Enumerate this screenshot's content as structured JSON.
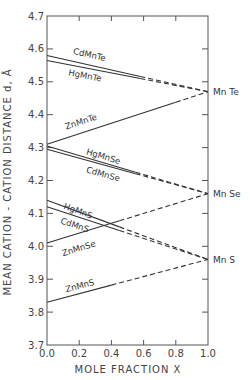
{
  "chart_data": {
    "type": "line",
    "title": "",
    "xlabel": "MOLE FRACTION X",
    "ylabel": "MEAN CATION - CATION DISTANCE  d, Å",
    "xlim": [
      0.0,
      1.0
    ],
    "ylim": [
      3.7,
      4.7
    ],
    "x_ticks": [
      "0.0",
      "0.2",
      "0.4",
      "0.6",
      "0.8",
      "1.0"
    ],
    "y_ticks": [
      "3.7",
      "3.8",
      "3.9",
      "4.0",
      "4.1",
      "4.2",
      "4.3",
      "4.4",
      "4.5",
      "4.6",
      "4.7"
    ],
    "grid": false,
    "legend": "inline labels",
    "endpoint_labels": [
      {
        "label": "Mn Te",
        "y": 4.47
      },
      {
        "label": "Mn Se",
        "y": 4.16
      },
      {
        "label": "Mn S",
        "y": 3.96
      }
    ],
    "series": [
      {
        "name": "CdMnTe",
        "x": [
          0.0,
          0.58,
          1.0
        ],
        "values": [
          4.58,
          4.516,
          4.47
        ],
        "solid_until": 0.58,
        "label_pos": [
          0.16,
          4.585
        ]
      },
      {
        "name": "HgMnTe",
        "x": [
          0.0,
          0.58,
          1.0
        ],
        "values": [
          4.565,
          4.51,
          4.47
        ],
        "solid_until": 0.58,
        "label_pos": [
          0.13,
          4.52
        ]
      },
      {
        "name": "ZnMnTe",
        "x": [
          0.0,
          0.8,
          1.0
        ],
        "values": [
          4.31,
          4.438,
          4.47
        ],
        "solid_until": 0.8,
        "label_pos": [
          0.12,
          4.355
        ]
      },
      {
        "name": "HgMnSe",
        "x": [
          0.0,
          0.6,
          1.0
        ],
        "values": [
          4.305,
          4.218,
          4.16
        ],
        "solid_until": 0.55,
        "label_pos": [
          0.24,
          4.28
        ]
      },
      {
        "name": "CdMnSe",
        "x": [
          0.0,
          0.6,
          1.0
        ],
        "values": [
          4.295,
          4.21,
          4.16
        ],
        "solid_until": 0.55,
        "label_pos": [
          0.24,
          4.225
        ]
      },
      {
        "name": "HgMnS",
        "x": [
          0.0,
          0.45,
          1.0
        ],
        "values": [
          4.14,
          4.06,
          3.96
        ],
        "solid_until": 0.45,
        "label_pos": [
          0.1,
          4.115
        ]
      },
      {
        "name": "CdMnS",
        "x": [
          0.0,
          0.45,
          1.0
        ],
        "values": [
          4.12,
          4.048,
          3.96
        ],
        "solid_until": 0.45,
        "label_pos": [
          0.08,
          4.07
        ]
      },
      {
        "name": "ZnMnSe",
        "x": [
          0.0,
          0.45,
          1.0
        ],
        "values": [
          4.01,
          4.072,
          4.16
        ],
        "solid_until": 0.45,
        "label_pos": [
          0.1,
          3.97
        ]
      },
      {
        "name": "ZnMnS",
        "x": [
          0.0,
          0.4,
          1.0
        ],
        "values": [
          3.83,
          3.88,
          3.96
        ],
        "solid_until": 0.4,
        "label_pos": [
          0.12,
          3.86
        ]
      }
    ]
  },
  "colors": {
    "line": "#333333",
    "axis": "#555555",
    "text": "#444444",
    "background": "#ffffff"
  }
}
